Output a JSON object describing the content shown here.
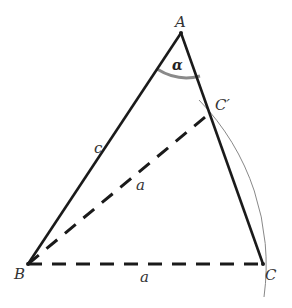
{
  "diagram": {
    "type": "geometry-triangle",
    "vertices": {
      "A": {
        "label": "A",
        "x": 181,
        "y": 33
      },
      "B": {
        "label": "B",
        "x": 28,
        "y": 264
      },
      "C": {
        "label": "C",
        "x": 263,
        "y": 264
      },
      "C_prime": {
        "label": "C′",
        "x": 210,
        "y": 113
      }
    },
    "edges": [
      {
        "from": "A",
        "to": "B",
        "style": "solid",
        "label": "c"
      },
      {
        "from": "A",
        "to": "C",
        "style": "solid",
        "label": ""
      },
      {
        "from": "B",
        "to": "C",
        "style": "dashed",
        "label": "a"
      },
      {
        "from": "B",
        "to": "C_prime",
        "style": "dashed",
        "label": "a"
      }
    ],
    "angle": {
      "at": "A",
      "label": "α",
      "color": "#888888"
    },
    "arc": {
      "center": "B",
      "radius_label": "a",
      "color": "#888888"
    },
    "labels": {
      "A": "A",
      "B": "B",
      "C": "C",
      "C_prime": "C′",
      "side_c": "c",
      "side_a_bottom": "a",
      "side_a_diag": "a",
      "alpha": "α"
    },
    "colors": {
      "line": "#1a1a1a",
      "arc": "#888888",
      "angle_arc": "#888888",
      "label": "#333333"
    }
  }
}
